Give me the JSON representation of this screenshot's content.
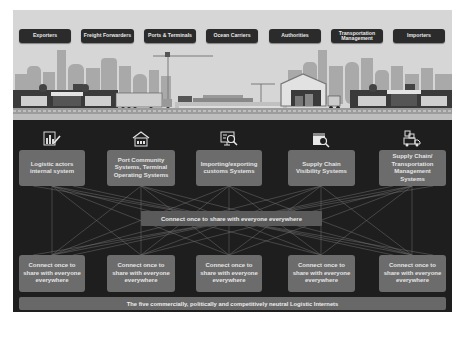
{
  "header": {
    "actors": [
      {
        "label": "Exporters"
      },
      {
        "label": "Freight Forwarders"
      },
      {
        "label": "Ports & Terminals"
      },
      {
        "label": "Ocean Carriers"
      },
      {
        "label": "Authorities"
      },
      {
        "label": "Transportation Management"
      },
      {
        "label": "Importers"
      }
    ]
  },
  "scene": {
    "description": "Logistics illustration: city skyline, warehouses, truck, container ship, crane, distribution center"
  },
  "systems": [
    {
      "icon": "chart-edit-icon",
      "label": "Logistic actors internal system"
    },
    {
      "icon": "port-house-icon",
      "label": "Port Community Systems, Terminal Operating Systems"
    },
    {
      "icon": "monitor-search-icon",
      "label": "Importing/exporting customs Systems"
    },
    {
      "icon": "calendar-search-icon",
      "label": "Supply Chain Visibility Systems"
    },
    {
      "icon": "truck-boxes-icon",
      "label": "Supply Chain/ Transportation Management Systems"
    }
  ],
  "middle_bar": {
    "label": "Connect once to share with everyone everywhere"
  },
  "connectors": [
    {
      "label": "Connect once to share with everyone everywhere"
    },
    {
      "label": "Connect once to share with everyone everywhere"
    },
    {
      "label": "Connect once to share with everyone everywhere"
    },
    {
      "label": "Connect once to share with everyone everywhere"
    },
    {
      "label": "Connect once to share with everyone everywhere"
    }
  ],
  "bottom_bar": {
    "label": "The five commercially, politically and competitively neutral Logistic Internets"
  },
  "colors": {
    "top_band": "#d6d6d6",
    "panel": "#1e1e1e",
    "header_button": "#2b2b2b",
    "box": "#6c6c6c",
    "middle_bar": "#5a5a5a",
    "bottom_bar": "#686868",
    "lines": "#8a8a8a"
  }
}
